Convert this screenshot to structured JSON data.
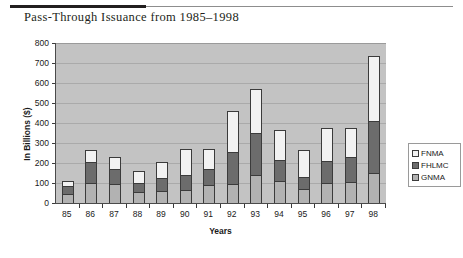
{
  "figure": {
    "title": "Pass-Through Issuance from 1985–1998"
  },
  "chart_data": {
    "type": "bar",
    "stacked": true,
    "title": "Pass-Through Issuance from 1985–1998",
    "xlabel": "Years",
    "ylabel": "In Billions ($)",
    "ylim": [
      0,
      800
    ],
    "ytick_step": 100,
    "yticks": [
      "800",
      "700",
      "600",
      "500",
      "400",
      "300",
      "200",
      "100",
      "0"
    ],
    "grid": true,
    "legend_position": "right",
    "categories": [
      "85",
      "86",
      "87",
      "88",
      "89",
      "90",
      "91",
      "92",
      "93",
      "94",
      "95",
      "96",
      "97",
      "98"
    ],
    "series": [
      {
        "name": "GNMA",
        "color": "#b2b2b2",
        "values": [
          45,
          100,
          95,
          55,
          60,
          65,
          90,
          95,
          140,
          110,
          70,
          100,
          105,
          150
        ]
      },
      {
        "name": "FHLMC",
        "color": "#6c6c6c",
        "values": [
          40,
          105,
          75,
          45,
          65,
          75,
          80,
          160,
          210,
          105,
          60,
          110,
          125,
          260
        ]
      },
      {
        "name": "FNMA",
        "color": "#f2f2f2",
        "values": [
          25,
          60,
          60,
          60,
          80,
          130,
          100,
          205,
          220,
          150,
          135,
          165,
          145,
          325
        ]
      }
    ],
    "totals": [
      110,
      265,
      230,
      160,
      205,
      270,
      270,
      460,
      570,
      365,
      265,
      375,
      375,
      735
    ],
    "segment_tops": {
      "gnma": [
        45,
        100,
        95,
        55,
        60,
        65,
        90,
        95,
        140,
        110,
        70,
        100,
        105,
        150
      ],
      "fhlmc": [
        85,
        205,
        170,
        100,
        125,
        140,
        170,
        255,
        350,
        215,
        130,
        210,
        230,
        410
      ]
    }
  },
  "legend": {
    "items": [
      {
        "label": "FNMA",
        "color": "#f2f2f2"
      },
      {
        "label": "FHLMC",
        "color": "#6c6c6c"
      },
      {
        "label": "GNMA",
        "color": "#b2b2b2"
      }
    ]
  }
}
